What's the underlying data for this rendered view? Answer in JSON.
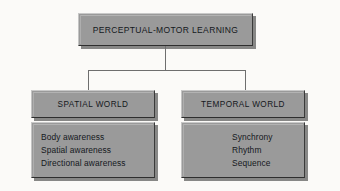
{
  "diagram": {
    "type": "hierarchy-flowchart",
    "background_color": "#fbfaf8",
    "box_fill_color": "#9a9a9a",
    "text_color": "#14181c",
    "connector_color": "#6e6e6e",
    "root": {
      "label": "PERCEPTUAL-MOTOR LEARNING"
    },
    "branches": [
      {
        "id": "spatial",
        "header": "SPATIAL WORLD",
        "items": [
          "Body awareness",
          "Spatial awareness",
          "Directional awareness"
        ]
      },
      {
        "id": "temporal",
        "header": "TEMPORAL WORLD",
        "items": [
          "Synchrony",
          "Rhythm",
          "Sequence"
        ]
      }
    ]
  }
}
